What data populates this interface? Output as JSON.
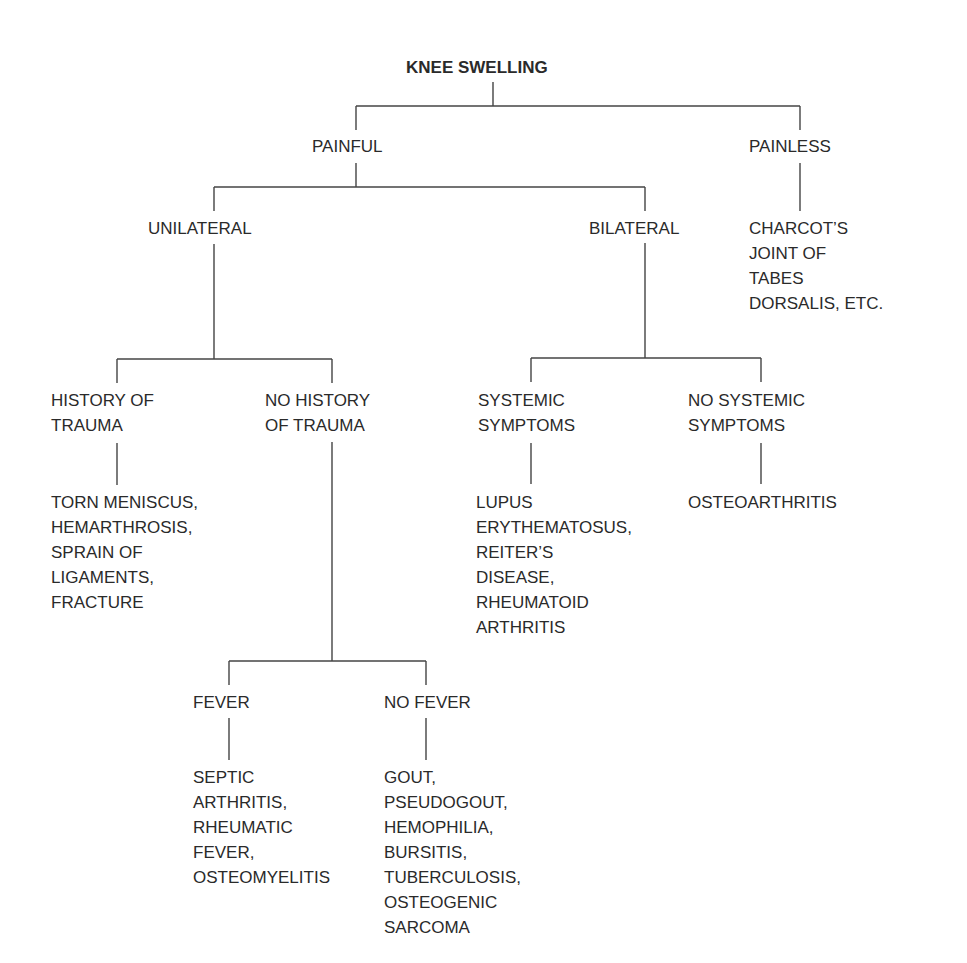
{
  "diagram": {
    "title": "KNEE SWELLING",
    "nodes": {
      "painful": "PAINFUL",
      "painless": "PAINLESS",
      "painless_result": "CHARCOT’S\nJOINT OF\nTABES\nDORSALIS, ETC.",
      "unilateral": "UNILATERAL",
      "bilateral": "BILATERAL",
      "history_trauma": "HISTORY OF\nTRAUMA",
      "no_history_trauma": "NO HISTORY\nOF TRAUMA",
      "history_trauma_result": "TORN MENISCUS,\nHEMARTHROSIS,\nSPRAIN OF\nLIGAMENTS,\nFRACTURE",
      "systemic": "SYSTEMIC\nSYMPTOMS",
      "no_systemic": "NO SYSTEMIC\nSYMPTOMS",
      "systemic_result": "LUPUS\nERYTHEMATOSUS,\nREITER’S\nDISEASE,\nRHEUMATOID\nARTHRITIS",
      "no_systemic_result": "OSTEOARTHRITIS",
      "fever": "FEVER",
      "no_fever": "NO FEVER",
      "fever_result": "SEPTIC\nARTHRITIS,\nRHEUMATIC\nFEVER,\nOSTEOMYELITIS",
      "no_fever_result": "GOUT,\nPSEUDOGOUT,\nHEMOPHILIA,\nBURSITIS,\nTUBERCULOSIS,\nOSTEOGENIC\nSARCOMA"
    }
  }
}
